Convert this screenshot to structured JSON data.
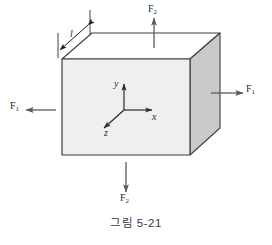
{
  "figure": {
    "caption": "그림 5-21",
    "kind": "physics-diagram",
    "colors": {
      "outline": "#3f3f3f",
      "front_face": "#efefef",
      "top_face": "#ffffff",
      "right_face": "#c9c9c9",
      "arrow": "#5a5a5a",
      "axis": "#2b2b2b",
      "text": "#2b2b2b",
      "caption_text": "#3a3a3a",
      "background": "#ffffff"
    },
    "labels": {
      "force_top": {
        "symbol": "F",
        "subscript": "2"
      },
      "force_bottom": {
        "symbol": "F",
        "subscript": "2"
      },
      "force_left": {
        "symbol": "F",
        "subscript": "1"
      },
      "force_right": {
        "symbol": "F",
        "subscript": "1"
      },
      "axis_x": "x",
      "axis_y": "y",
      "axis_z": "z",
      "dimension_length": "l"
    },
    "arrows": [
      {
        "name": "force-arrow-top",
        "direction": "up",
        "label": "F2"
      },
      {
        "name": "force-arrow-bottom",
        "direction": "down",
        "label": "F2"
      },
      {
        "name": "force-arrow-left",
        "direction": "left",
        "label": "F1"
      },
      {
        "name": "force-arrow-right",
        "direction": "right",
        "label": "F1"
      },
      {
        "name": "dimension-arrow-length",
        "direction": "double",
        "label": "l"
      }
    ],
    "axes": [
      {
        "name": "axis-y",
        "direction": "up",
        "label": "y"
      },
      {
        "name": "axis-x",
        "direction": "right",
        "label": "x"
      },
      {
        "name": "axis-z",
        "direction": "down-left",
        "label": "z"
      }
    ]
  }
}
